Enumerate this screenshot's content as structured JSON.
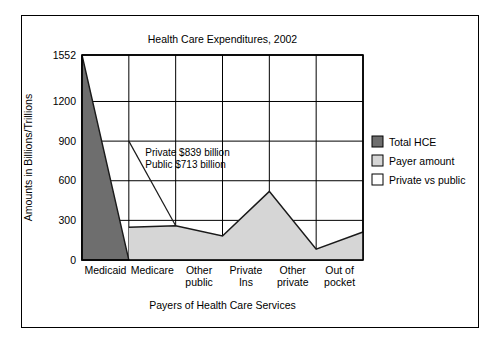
{
  "figure": {
    "background_color": "#ffffff",
    "frame_color": "#000000"
  },
  "chart_data": {
    "type": "area",
    "title": "Health Care Expenditures, 2002",
    "xlabel": "Payers of Health Care Services",
    "ylabel": "Amounts in Billions/Trillions",
    "categories": [
      "Medicaid",
      "Medicare",
      "Other public",
      "Private Ins",
      "Other private",
      "Out of pocket"
    ],
    "category_lines": [
      [
        "Medicaid"
      ],
      [
        "Medicare"
      ],
      [
        "Other",
        "public"
      ],
      [
        "Private",
        "Ins"
      ],
      [
        "Other",
        "private"
      ],
      [
        "Out of",
        "pocket"
      ]
    ],
    "ylim": [
      0,
      1552
    ],
    "yticks": [
      0,
      300,
      600,
      900,
      1200,
      1552
    ],
    "ytick_labels": [
      "0",
      "300",
      "600",
      "900",
      "1200",
      "1552"
    ],
    "grid": true,
    "legend_position": "right",
    "series": [
      {
        "name": "Total HCE",
        "color": "#6e6e6e",
        "kind": "area",
        "x": [
          0,
          1
        ],
        "values": [
          1552,
          0
        ]
      },
      {
        "name": "Payer amount",
        "color": "#d6d6d6",
        "kind": "area",
        "x": [
          1,
          2,
          3,
          4,
          5,
          6
        ],
        "values": [
          248,
          259,
          182,
          520,
          82,
          212
        ]
      },
      {
        "name": "Private vs public",
        "color": "#ffffff",
        "kind": "line",
        "x": [
          1,
          2
        ],
        "values": [
          900,
          259
        ]
      }
    ],
    "annotations": [
      {
        "lines": [
          "Private $839 billion",
          "Public $713 billion"
        ],
        "x": 1.35,
        "y": 790
      }
    ]
  },
  "legend": {
    "items": [
      {
        "label": "Total HCE",
        "color": "#6e6e6e"
      },
      {
        "label": "Payer amount",
        "color": "#d6d6d6"
      },
      {
        "label": "Private vs public",
        "color": "#ffffff"
      }
    ]
  }
}
